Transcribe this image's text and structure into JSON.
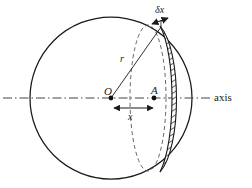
{
  "figure": {
    "type": "geometric-diagram",
    "background_color": "#ffffff",
    "stroke_color": "#1a1a1a",
    "hatch_color": "#333333",
    "dash_color": "#555555",
    "labels": {
      "center_point": "O",
      "offset_point": "A",
      "radius": "r",
      "distance": "x",
      "thickness": "δx",
      "axis": "axis"
    },
    "geometry": {
      "circle_center_x": 111,
      "circle_center_y": 98,
      "circle_radius": 81,
      "point_O_x": 111,
      "point_O_y": 98,
      "point_A_x": 154,
      "point_A_y": 98,
      "slab_inner_x": 166,
      "slab_outer_x": 176,
      "dashed_ellipse_rx": 18,
      "arrow_x_start": 112,
      "arrow_x_end": 155,
      "arrow_y": 108
    }
  }
}
